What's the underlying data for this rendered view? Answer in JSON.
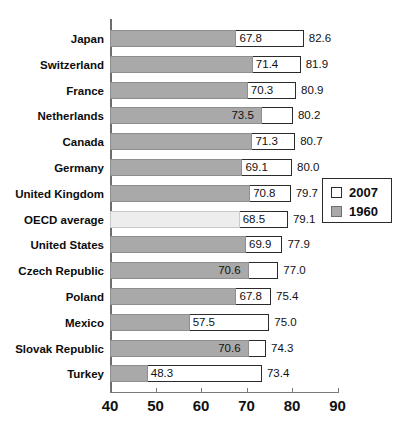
{
  "chart_data": {
    "type": "bar",
    "orientation": "horizontal",
    "style": "overlapped",
    "title": "",
    "xlabel": "",
    "ylabel": "",
    "xlim": [
      40,
      90
    ],
    "xticks": [
      40,
      50,
      60,
      70,
      80,
      90
    ],
    "xtick_labels": [
      "40",
      "50",
      "60",
      "70",
      "80",
      "90"
    ],
    "grid": false,
    "legend_position": "right-middle",
    "categories": [
      "Japan",
      "Switzerland",
      "France",
      "Netherlands",
      "Canada",
      "Germany",
      "United Kingdom",
      "OECD average",
      "United States",
      "Czech Republic",
      "Poland",
      "Mexico",
      "Slovak Republic",
      "Turkey"
    ],
    "series": [
      {
        "name": "2007",
        "color": "#ffffff",
        "values": [
          82.6,
          81.9,
          80.9,
          80.2,
          80.7,
          80.0,
          79.7,
          79.1,
          77.9,
          77.0,
          75.4,
          75.0,
          74.3,
          73.4
        ],
        "labels": [
          "82.6",
          "81.9",
          "80.9",
          "80.2",
          "80.7",
          "80.0",
          "79.7",
          "79.1",
          "77.9",
          "77.0",
          "75.4",
          "75.0",
          "74.3",
          "73.4"
        ]
      },
      {
        "name": "1960",
        "color": "#a9a9a9",
        "values": [
          67.8,
          71.4,
          70.3,
          73.5,
          71.3,
          69.1,
          70.8,
          68.5,
          69.9,
          70.6,
          67.8,
          57.5,
          70.6,
          48.3
        ],
        "labels": [
          "67.8",
          "71.4",
          "70.3",
          "73.5",
          "71.3",
          "69.1",
          "70.8",
          "68.5",
          "69.9",
          "70.6",
          "67.8",
          "57.5",
          "70.6",
          "48.3"
        ]
      }
    ],
    "highlight_row": "OECD average",
    "highlight_color": "#ededed"
  },
  "legend": {
    "items": [
      {
        "label": "2007",
        "swatch": "white"
      },
      {
        "label": "1960",
        "swatch": "gray"
      }
    ]
  }
}
